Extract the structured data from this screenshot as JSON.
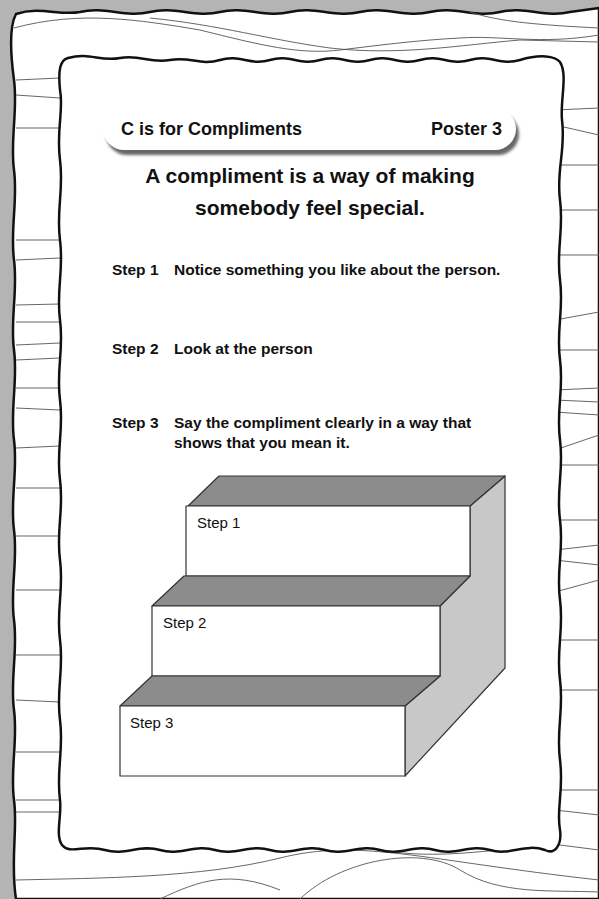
{
  "header": {
    "title": "C is for Compliments",
    "poster_label": "Poster 3"
  },
  "intro": {
    "line1": "A compliment is a way of making",
    "line2": "somebody feel special."
  },
  "steps": [
    {
      "number": "Step 1",
      "text": "Notice something you like about the person."
    },
    {
      "number": "Step 2",
      "text": "Look at the person"
    },
    {
      "number": "Step 3",
      "text": "Say the compliment clearly in a way that shows that you mean it."
    }
  ],
  "staircase": {
    "labels": [
      "Step 1",
      "Step 2",
      "Step 3"
    ]
  },
  "colors": {
    "background": "#b4b4b4",
    "paper": "#ffffff",
    "border": "#111111",
    "tread": "#8a8a8a",
    "side": "#c8c8c8"
  }
}
